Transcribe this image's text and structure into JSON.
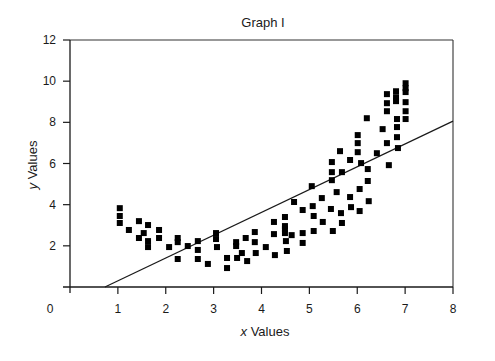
{
  "chart_data": {
    "type": "scatter",
    "title": "Graph I",
    "xlabel": "x Values",
    "xlabel_var": "x",
    "xlabel_rest": " Values",
    "ylabel": "y Values",
    "ylabel_var": "y",
    "ylabel_rest": " Values",
    "xlim": [
      0,
      8
    ],
    "ylim": [
      0,
      12
    ],
    "xticks": [
      0,
      1,
      2,
      3,
      4,
      5,
      6,
      7,
      8
    ],
    "yticks": [
      2,
      4,
      6,
      8,
      10,
      12
    ],
    "grid": false,
    "legend": null,
    "marker": "square",
    "series": [
      {
        "name": "data",
        "points": [
          [
            1.04,
            3.83
          ],
          [
            1.04,
            3.45
          ],
          [
            1.04,
            3.11
          ],
          [
            1.23,
            2.77
          ],
          [
            1.44,
            3.2
          ],
          [
            1.63,
            3.01
          ],
          [
            1.54,
            2.62
          ],
          [
            1.44,
            2.38
          ],
          [
            1.63,
            2.23
          ],
          [
            1.63,
            1.94
          ],
          [
            1.86,
            2.77
          ],
          [
            1.86,
            2.38
          ],
          [
            2.07,
            1.94
          ],
          [
            2.25,
            2.38
          ],
          [
            2.25,
            2.18
          ],
          [
            2.25,
            1.36
          ],
          [
            2.46,
            1.99
          ],
          [
            2.67,
            2.23
          ],
          [
            2.67,
            1.8
          ],
          [
            2.67,
            1.36
          ],
          [
            2.88,
            1.12
          ],
          [
            3.05,
            2.62
          ],
          [
            3.05,
            2.33
          ],
          [
            3.07,
            1.94
          ],
          [
            3.28,
            1.41
          ],
          [
            3.28,
            0.92
          ],
          [
            3.47,
            2.18
          ],
          [
            3.47,
            1.99
          ],
          [
            3.49,
            1.41
          ],
          [
            3.59,
            1.65
          ],
          [
            3.67,
            2.38
          ],
          [
            3.7,
            1.26
          ],
          [
            3.86,
            2.67
          ],
          [
            3.86,
            2.18
          ],
          [
            3.88,
            1.65
          ],
          [
            4.09,
            1.94
          ],
          [
            4.26,
            3.16
          ],
          [
            4.26,
            2.57
          ],
          [
            4.28,
            1.55
          ],
          [
            4.49,
            3.4
          ],
          [
            4.49,
            2.96
          ],
          [
            4.49,
            2.82
          ],
          [
            4.49,
            2.62
          ],
          [
            4.51,
            2.23
          ],
          [
            4.53,
            1.75
          ],
          [
            4.63,
            2.52
          ],
          [
            4.68,
            4.13
          ],
          [
            4.86,
            3.74
          ],
          [
            4.86,
            2.62
          ],
          [
            4.86,
            2.14
          ],
          [
            5.07,
            3.93
          ],
          [
            5.09,
            3.45
          ],
          [
            5.09,
            2.72
          ],
          [
            5.05,
            4.9
          ],
          [
            5.26,
            4.32
          ],
          [
            5.28,
            3.16
          ],
          [
            5.45,
            3.79
          ],
          [
            5.47,
            6.07
          ],
          [
            5.47,
            5.58
          ],
          [
            5.47,
            5.19
          ],
          [
            5.49,
            2.72
          ],
          [
            5.57,
            4.61
          ],
          [
            5.64,
            6.6
          ],
          [
            5.66,
            3.59
          ],
          [
            5.68,
            5.58
          ],
          [
            5.68,
            3.11
          ],
          [
            5.85,
            6.17
          ],
          [
            5.85,
            4.37
          ],
          [
            5.87,
            3.88
          ],
          [
            6.01,
            7.38
          ],
          [
            6.01,
            6.99
          ],
          [
            6.01,
            6.55
          ],
          [
            6.05,
            4.76
          ],
          [
            6.05,
            3.69
          ],
          [
            6.08,
            6.02
          ],
          [
            6.2,
            8.2
          ],
          [
            6.22,
            5.73
          ],
          [
            6.22,
            5.15
          ],
          [
            6.24,
            4.17
          ],
          [
            6.41,
            6.5
          ],
          [
            6.53,
            7.67
          ],
          [
            6.62,
            9.37
          ],
          [
            6.62,
            8.93
          ],
          [
            6.62,
            8.54
          ],
          [
            6.62,
            6.99
          ],
          [
            6.66,
            5.92
          ],
          [
            6.81,
            9.51
          ],
          [
            6.81,
            9.22
          ],
          [
            6.81,
            9.03
          ],
          [
            6.83,
            8.16
          ],
          [
            6.83,
            7.77
          ],
          [
            6.83,
            7.28
          ],
          [
            6.85,
            6.75
          ],
          [
            7.01,
            9.9
          ],
          [
            7.01,
            9.66
          ],
          [
            7.01,
            9.47
          ],
          [
            7.01,
            8.98
          ],
          [
            7.01,
            8.54
          ],
          [
            7.01,
            8.16
          ]
        ]
      }
    ],
    "regression_line": {
      "name": "linear fit",
      "x0": 0.73,
      "y0": 0.0,
      "x1": 8.0,
      "y1": 8.06,
      "slope": 1.11,
      "intercept": -0.81
    }
  }
}
